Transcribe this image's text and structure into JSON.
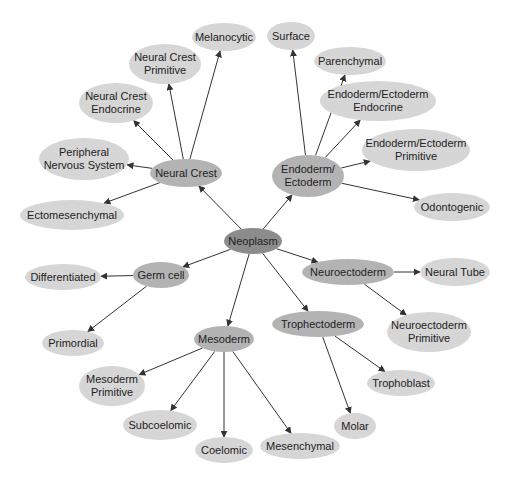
{
  "diagram": {
    "type": "hierarchy-tree",
    "colors": {
      "root": "#8c8c8c",
      "category": "#b3b3b3",
      "leaf": "#d6d6d6",
      "edge": "#333333",
      "text": "#222222"
    },
    "root": {
      "label": "Neoplasm"
    },
    "nodes": [
      {
        "id": "neoplasm",
        "label": "Neoplasm",
        "level": "root",
        "x": 253,
        "y": 241,
        "w": 58,
        "h": 26
      },
      {
        "id": "neural_crest",
        "label": "Neural Crest",
        "level": "category",
        "x": 186,
        "y": 173,
        "w": 72,
        "h": 28
      },
      {
        "id": "endo_ecto",
        "label": "Endoderm/\nEctoderm",
        "level": "category",
        "x": 308,
        "y": 176,
        "w": 72,
        "h": 42
      },
      {
        "id": "germ_cell",
        "label": "Germ cell",
        "level": "category",
        "x": 161,
        "y": 275,
        "w": 56,
        "h": 26
      },
      {
        "id": "neuroectoderm",
        "label": "Neuroectoderm",
        "level": "category",
        "x": 348,
        "y": 272,
        "w": 92,
        "h": 26
      },
      {
        "id": "trophectoderm",
        "label": "Trophectoderm",
        "level": "category",
        "x": 318,
        "y": 324,
        "w": 92,
        "h": 26
      },
      {
        "id": "mesoderm",
        "label": "Mesoderm",
        "level": "category",
        "x": 224,
        "y": 339,
        "w": 60,
        "h": 26
      },
      {
        "id": "melanocytic",
        "label": "Melanocytic",
        "level": "leaf",
        "x": 224,
        "y": 37,
        "w": 64,
        "h": 28
      },
      {
        "id": "nc_primitive",
        "label": "Neural Crest\nPrimitive",
        "level": "leaf",
        "x": 165,
        "y": 64,
        "w": 72,
        "h": 40
      },
      {
        "id": "nc_endocrine",
        "label": "Neural Crest\nEndocrine",
        "level": "leaf",
        "x": 116,
        "y": 103,
        "w": 74,
        "h": 40
      },
      {
        "id": "pns",
        "label": "Peripheral\nNervous System",
        "level": "leaf",
        "x": 84,
        "y": 159,
        "w": 90,
        "h": 42
      },
      {
        "id": "ectomesenchymal",
        "label": "Ectomesenchymal",
        "level": "leaf",
        "x": 72,
        "y": 215,
        "w": 104,
        "h": 30
      },
      {
        "id": "surface",
        "label": "Surface",
        "level": "leaf",
        "x": 291,
        "y": 36,
        "w": 48,
        "h": 28
      },
      {
        "id": "parenchymal",
        "label": "Parenchymal",
        "level": "leaf",
        "x": 350,
        "y": 61,
        "w": 72,
        "h": 28
      },
      {
        "id": "ee_endocrine",
        "label": "Endoderm/Ectoderm\nEndocrine",
        "level": "leaf",
        "x": 378,
        "y": 101,
        "w": 116,
        "h": 40
      },
      {
        "id": "ee_primitive",
        "label": "Endoderm/Ectoderm\nPrimitive",
        "level": "leaf",
        "x": 416,
        "y": 150,
        "w": 108,
        "h": 42
      },
      {
        "id": "odontogenic",
        "label": "Odontogenic",
        "level": "leaf",
        "x": 452,
        "y": 207,
        "w": 76,
        "h": 28
      },
      {
        "id": "differentiated",
        "label": "Differentiated",
        "level": "leaf",
        "x": 63,
        "y": 277,
        "w": 76,
        "h": 26
      },
      {
        "id": "primordial",
        "label": "Primordial",
        "level": "leaf",
        "x": 73,
        "y": 343,
        "w": 62,
        "h": 26
      },
      {
        "id": "neural_tube",
        "label": "Neural Tube",
        "level": "leaf",
        "x": 455,
        "y": 272,
        "w": 70,
        "h": 28
      },
      {
        "id": "ne_primitive",
        "label": "Neuroectoderm\nPrimitive",
        "level": "leaf",
        "x": 429,
        "y": 332,
        "w": 84,
        "h": 40
      },
      {
        "id": "trophoblast",
        "label": "Trophoblast",
        "level": "leaf",
        "x": 401,
        "y": 383,
        "w": 68,
        "h": 26
      },
      {
        "id": "molar",
        "label": "Molar",
        "level": "leaf",
        "x": 355,
        "y": 426,
        "w": 42,
        "h": 26
      },
      {
        "id": "mesoderm_primitive",
        "label": "Mesoderm\nPrimitive",
        "level": "leaf",
        "x": 112,
        "y": 386,
        "w": 66,
        "h": 40
      },
      {
        "id": "subcoelomic",
        "label": "Subcoelomic",
        "level": "leaf",
        "x": 160,
        "y": 425,
        "w": 74,
        "h": 30
      },
      {
        "id": "coelomic",
        "label": "Coelomic",
        "level": "leaf",
        "x": 224,
        "y": 450,
        "w": 58,
        "h": 26
      },
      {
        "id": "mesenchymal",
        "label": "Mesenchymal",
        "level": "leaf",
        "x": 300,
        "y": 446,
        "w": 80,
        "h": 26
      }
    ],
    "edges": [
      [
        "neoplasm",
        "neural_crest"
      ],
      [
        "neoplasm",
        "endo_ecto"
      ],
      [
        "neoplasm",
        "germ_cell"
      ],
      [
        "neoplasm",
        "neuroectoderm"
      ],
      [
        "neoplasm",
        "trophectoderm"
      ],
      [
        "neoplasm",
        "mesoderm"
      ],
      [
        "neural_crest",
        "melanocytic"
      ],
      [
        "neural_crest",
        "nc_primitive"
      ],
      [
        "neural_crest",
        "nc_endocrine"
      ],
      [
        "neural_crest",
        "pns"
      ],
      [
        "neural_crest",
        "ectomesenchymal"
      ],
      [
        "endo_ecto",
        "surface"
      ],
      [
        "endo_ecto",
        "parenchymal"
      ],
      [
        "endo_ecto",
        "ee_endocrine"
      ],
      [
        "endo_ecto",
        "ee_primitive"
      ],
      [
        "endo_ecto",
        "odontogenic"
      ],
      [
        "germ_cell",
        "differentiated"
      ],
      [
        "germ_cell",
        "primordial"
      ],
      [
        "neuroectoderm",
        "neural_tube"
      ],
      [
        "neuroectoderm",
        "ne_primitive"
      ],
      [
        "trophectoderm",
        "trophoblast"
      ],
      [
        "trophectoderm",
        "molar"
      ],
      [
        "mesoderm",
        "mesoderm_primitive"
      ],
      [
        "mesoderm",
        "subcoelomic"
      ],
      [
        "mesoderm",
        "coelomic"
      ],
      [
        "mesoderm",
        "mesenchymal"
      ]
    ]
  }
}
